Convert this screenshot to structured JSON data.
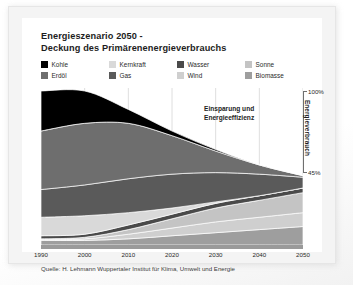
{
  "title": {
    "line1": "Energieszenario 2050 -",
    "line2": "Deckung des Primärenenergieverbrauchs"
  },
  "legend": {
    "items": [
      {
        "label": "Kohle",
        "color": "#000000",
        "key": "kohle"
      },
      {
        "label": "Kernkraft",
        "color": "#d9d9d9",
        "key": "kernkraft"
      },
      {
        "label": "Wasser",
        "color": "#4a4a4a",
        "key": "wasser"
      },
      {
        "label": "Sonne",
        "color": "#c4c4c4",
        "key": "sonne"
      },
      {
        "label": "Erdöl",
        "color": "#6e6e6e",
        "key": "erdoel"
      },
      {
        "label": "Gas",
        "color": "#5a5a5a",
        "key": "gas"
      },
      {
        "label": "Wind",
        "color": "#cfcfcf",
        "key": "wind"
      },
      {
        "label": "Biomasse",
        "color": "#9e9e9e",
        "key": "biomasse"
      }
    ]
  },
  "annotation": {
    "line1": "Einsparung und",
    "line2": "Energieeffizienz"
  },
  "axis_right": {
    "top_label": "100%",
    "bottom_label": "45%",
    "vertical_label": "Energieverbrauch"
  },
  "source": "Quelle: H. Lehmann Wuppertaler Institut für Klima, Umwelt und Energie",
  "chart_data": {
    "type": "area",
    "title": "Energieszenario 2050 - Deckung des Primärenenergieverbrauchs",
    "xlabel": "",
    "ylabel": "Energieverbrauch",
    "x": [
      1990,
      2000,
      2010,
      2020,
      2030,
      2040,
      2050
    ],
    "tick_labels": [
      "1990",
      "2000",
      "2010",
      "2020",
      "2030",
      "2040",
      "2050"
    ],
    "xlim": [
      1990,
      2050
    ],
    "ylim": [
      0,
      100
    ],
    "yunit": "%",
    "y_annotated_ticks": [
      "100%",
      "45%"
    ],
    "grid": "vertical-only",
    "legend_position": "top",
    "stacked": true,
    "note": "Total primary energy demand falls from 100% in 1990 to 45% in 2050; the gap above the stack is labelled 'Einsparung und Energieeffizienz' (saving and energy efficiency).",
    "total": [
      100,
      100,
      88,
      74,
      62,
      52,
      45
    ],
    "series": [
      {
        "name": "Biomasse",
        "color": "#9e9e9e",
        "values": [
          3,
          3,
          4,
          6,
          8,
          10,
          12
        ]
      },
      {
        "name": "Wind",
        "color": "#cfcfcf",
        "values": [
          0.5,
          1,
          3,
          5,
          7,
          8,
          9
        ]
      },
      {
        "name": "Sonne",
        "color": "#c4c4c4",
        "values": [
          0.5,
          1,
          3,
          6,
          9,
          11,
          13
        ]
      },
      {
        "name": "Wasser",
        "color": "#4a4a4a",
        "values": [
          2,
          2,
          3,
          3,
          3,
          3,
          3
        ]
      },
      {
        "name": "Kernkraft",
        "color": "#d9d9d9",
        "values": [
          12,
          12,
          8,
          4,
          1,
          0,
          0
        ]
      },
      {
        "name": "Gas",
        "color": "#5a5a5a",
        "values": [
          18,
          20,
          22,
          22,
          19,
          14,
          7
        ]
      },
      {
        "name": "Erdöl",
        "color": "#6e6e6e",
        "values": [
          38,
          40,
          36,
          25,
          14,
          6,
          1
        ]
      },
      {
        "name": "Kohle",
        "color": "#000000",
        "values": [
          26,
          21,
          9,
          3,
          1,
          0,
          0
        ]
      }
    ]
  }
}
